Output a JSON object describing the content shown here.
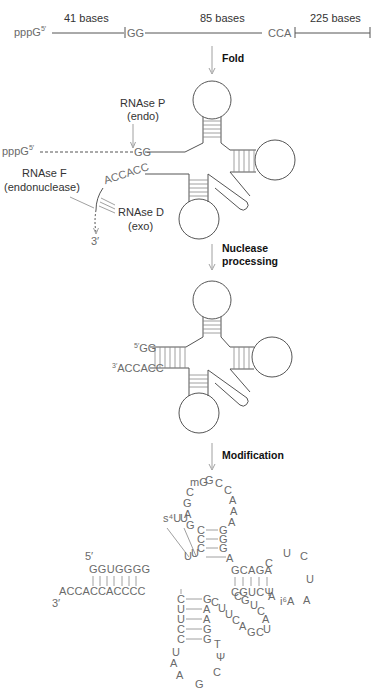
{
  "precursor": {
    "five_prime_label": "pppG",
    "five_prime_sup": "5′",
    "segments": [
      {
        "label": "41 bases"
      },
      {
        "label": "85 bases"
      },
      {
        "label": "225 bases"
      }
    ],
    "gg": "GG",
    "cca": "CCA"
  },
  "steps": {
    "fold": "Fold",
    "nuclease_1": "Nuclease",
    "nuclease_2": "processing",
    "modification": "Modification"
  },
  "folded": {
    "rnase_p_1": "RNAse P",
    "rnase_p_2": "(endo)",
    "five_prime_label": "pppG",
    "five_prime_sup": "5′",
    "gg": "GG",
    "tail": "ACCACC",
    "rnase_f_1": "RNAse F",
    "rnase_f_2": "(endonuclease)",
    "rnase_d_1": "RNAse D",
    "rnase_d_2": "(exo)",
    "three_prime": "3′"
  },
  "processed": {
    "five_sup": "5′",
    "gg": "GG",
    "three_sup": "3′",
    "tail": "ACCACC"
  },
  "mature": {
    "five_prime": "5′",
    "three_prime": "3′",
    "acceptor_top": "GGUGGGG",
    "acceptor_bottom": "ACCACCACCCC",
    "anticodon_loop_left": [
      "G",
      "A",
      "G",
      "C"
    ],
    "anticodon_loop_top": [
      "mG",
      "G",
      "C"
    ],
    "anticodon_loop_right": [
      "C",
      "A",
      "A",
      "A"
    ],
    "stem_left": [
      "C",
      "C",
      "C"
    ],
    "stem_right": [
      "G",
      "G",
      "G"
    ],
    "s4u": "s⁴U",
    "u_mod": "U",
    "junction_uu": [
      "U",
      "U"
    ],
    "junction_a": "A",
    "arm_right_top": "GCAGA",
    "arm_right_bottom": "CGUCΨ",
    "loop_right": [
      "C",
      "U",
      "C",
      "U",
      "A",
      "i⁶A",
      "A"
    ],
    "lower_stem_left": [
      "C",
      "U",
      "U",
      "C",
      "C"
    ],
    "lower_stem_right": [
      "G",
      "A",
      "A",
      "G",
      "G"
    ],
    "lower_loop": [
      "U",
      "A",
      "A",
      "G",
      "C",
      "Ψ",
      "T"
    ],
    "variable": [
      "C",
      "U",
      "U",
      "C",
      "A",
      "G",
      "C",
      "U",
      "A",
      "C",
      "U",
      "G",
      "C"
    ]
  }
}
